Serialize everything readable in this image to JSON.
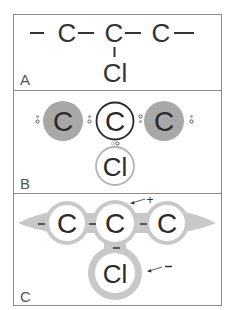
{
  "panels": {
    "a": {
      "label": "A",
      "atoms": [
        "C",
        "C",
        "C",
        "Cl"
      ],
      "bond": "—",
      "left_bond": "—",
      "right_bond": "—"
    },
    "b": {
      "label": "B",
      "atoms": [
        "C",
        "C",
        "C",
        "Cl"
      ]
    },
    "c": {
      "label": "C",
      "atoms": [
        "C",
        "C",
        "C",
        "Cl"
      ],
      "charges": [
        "-",
        "-",
        "-",
        "-"
      ],
      "positive_annotation": "+",
      "negative_annotation": "—"
    }
  },
  "colors": {
    "frame": "#888888",
    "text": "#333333",
    "dark_atom": "#a6a6a6",
    "cloud": "#c8c8c8",
    "ring_dark": "#2a2a2a",
    "ring_light": "#b0b0b0"
  }
}
